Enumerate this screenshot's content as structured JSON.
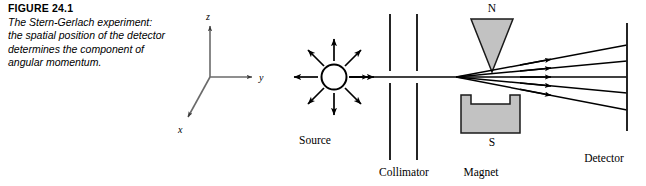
{
  "figure": {
    "number_label": "FIGURE 24.1",
    "caption": "The Stern-Gerlach experiment: the spatial position of the detector determines the component of angular momentum."
  },
  "axes": {
    "z_label": "z",
    "y_label": "y",
    "x_label": "x"
  },
  "apparatus": {
    "source_label": "Source",
    "collimator_label": "Collimator",
    "magnet_label": "Magnet",
    "detector_label": "Detector",
    "north_pole_label": "N",
    "south_pole_label": "S"
  },
  "colors": {
    "ink": "#000000",
    "pole_fill": "#c2c2c2",
    "pole_stroke": "#1a1a1a",
    "axis_line": "#5a5a5a",
    "background": "#ffffff"
  },
  "beams": {
    "count": 5,
    "description": "five deflected trajectories fanning from the magnet gap to the detector"
  },
  "source_rays": {
    "count": 8,
    "description": "eight arrows radiating isotropically from the source"
  }
}
